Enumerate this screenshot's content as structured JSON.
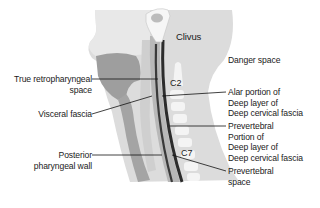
{
  "diagram": {
    "type": "anatomical-sagittal-section",
    "colors": {
      "background": "#ffffff",
      "skin_soft_tissue": "#dcdcdc",
      "face_highlight": "#ebebeb",
      "tongue_pharynx_muscle": "#9e9e9e",
      "prevertebral_band": "#bdbdbd",
      "fascia_dark": "#3a3a3a",
      "vertebra": "#f4f4f4",
      "leader_line": "#111111",
      "text": "#1a1a1a"
    }
  },
  "labels": {
    "clivus": "Clivus",
    "danger_space": "Danger space",
    "c2": "C2",
    "c7": "C7",
    "true_retropharyngeal": [
      "True retropharyngeal",
      "space"
    ],
    "visceral_fascia": "Visceral fascia",
    "posterior_pharyngeal_wall": [
      "Posterior",
      "pharyngeal wall"
    ],
    "alar_portion": [
      "Alar portion of",
      "Deep layer of",
      "Deep cervical fascia"
    ],
    "prevertebral_portion": [
      "Prevertebral",
      "Portion of",
      "Deep layer of",
      "Deep cervical fascia"
    ],
    "prevertebral_space": [
      "Prevertebral",
      "space"
    ]
  }
}
